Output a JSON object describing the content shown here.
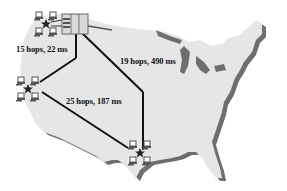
{
  "diagram": {
    "title": "",
    "colors": {
      "land": "#e6e6e6",
      "land_shadow": "#6e6e6e",
      "link": "#111111",
      "node_star": "#222222",
      "computer": "#555555",
      "server_box": "#d8d8d8"
    },
    "nodes": [
      {
        "id": "northwest",
        "type": "server-cluster",
        "icon": "star-with-computers-and-server"
      },
      {
        "id": "west",
        "type": "cluster",
        "icon": "star-with-computers"
      },
      {
        "id": "south",
        "type": "cluster",
        "icon": "star-with-computers"
      }
    ],
    "links": [
      {
        "from": "northwest",
        "to": "west",
        "label": "15 hops, 22 ms"
      },
      {
        "from": "northwest",
        "to": "south",
        "label": "19 hops, 490 ms"
      },
      {
        "from": "west",
        "to": "south",
        "label": "25 hops, 187 ms"
      }
    ]
  }
}
